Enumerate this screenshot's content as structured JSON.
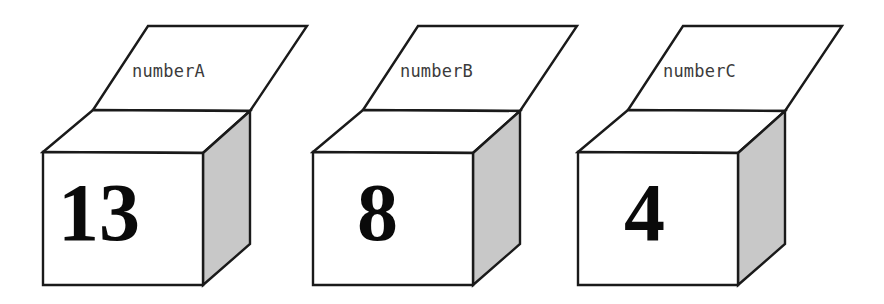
{
  "figure": {
    "title": "",
    "background_color": "#ffffff",
    "stroke_color": "#1a1a1a",
    "front_face_color": "#ffffff",
    "top_face_color": "#ffffff",
    "side_face_color": "#c8c8c8",
    "label_color": "#3b3b3b",
    "number_color": "#0a0a0a"
  },
  "boxes": [
    {
      "id": "box-a",
      "label": "numberA",
      "value": "13",
      "label_left": 132,
      "label_top": 61,
      "number_left": 58,
      "number_top": 172,
      "number_size": 82,
      "group_left": 0,
      "group_width": 320
    },
    {
      "id": "box-b",
      "label": "numberB",
      "value": "8",
      "label_left": 400,
      "label_top": 61,
      "number_left": 357,
      "number_top": 172,
      "number_size": 82,
      "group_left": 268,
      "group_width": 320
    },
    {
      "id": "box-c",
      "label": "numberC",
      "value": "4",
      "label_left": 663,
      "label_top": 61,
      "number_left": 624,
      "number_top": 172,
      "number_size": 82,
      "group_left": 532,
      "group_width": 330
    }
  ]
}
